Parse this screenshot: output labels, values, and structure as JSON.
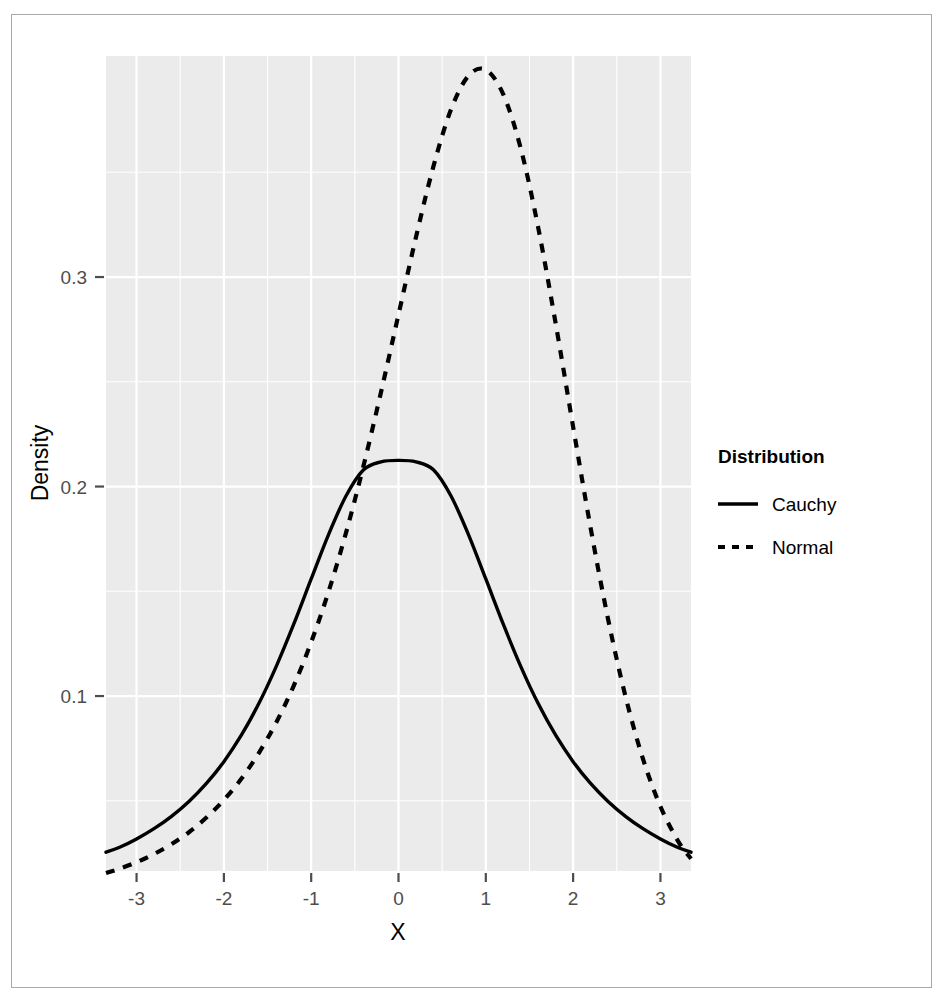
{
  "chart_data": {
    "type": "line",
    "title": "",
    "subtitle": "",
    "xlabel": "X",
    "ylabel": "Density",
    "xlim": [
      -3.35,
      3.35
    ],
    "ylim": [
      0.0165,
      0.4055
    ],
    "xticks": [
      -3,
      -2,
      -1,
      0,
      1,
      2,
      3
    ],
    "xticklabels": [
      "-3",
      "-2",
      "-1",
      "0",
      "1",
      "2",
      "3"
    ],
    "yticks": [
      0.1,
      0.2,
      0.3
    ],
    "yticklabels": [
      "0.1",
      "0.2",
      "0.3"
    ],
    "grid": true,
    "grid_color": "#ffffff",
    "panel_background": "#ebebeb",
    "legend": {
      "title": "Distribution",
      "position": "right",
      "entries": [
        {
          "name": "Cauchy",
          "linestyle": "solid",
          "color": "#000000"
        },
        {
          "name": "Normal",
          "linestyle": "dashed",
          "color": "#000000"
        }
      ]
    },
    "series": [
      {
        "name": "Cauchy",
        "linestyle": "solid",
        "color": "#000000",
        "x": [
          -3.35,
          -3.2,
          -3.0,
          -2.8,
          -2.6,
          -2.4,
          -2.2,
          -2.0,
          -1.8,
          -1.6,
          -1.4,
          -1.2,
          -1.0,
          -0.8,
          -0.6,
          -0.4,
          -0.2,
          0.0,
          0.2,
          0.4,
          0.6,
          0.8,
          1.0,
          1.2,
          1.4,
          1.6,
          1.8,
          2.0,
          2.2,
          2.4,
          2.6,
          2.8,
          3.0,
          3.2,
          3.35
        ],
        "y": [
          0.0255,
          0.0277,
          0.0318,
          0.0367,
          0.0426,
          0.0497,
          0.0583,
          0.0687,
          0.0813,
          0.0964,
          0.1142,
          0.1343,
          0.1559,
          0.1772,
          0.1956,
          0.208,
          0.2118,
          0.2125,
          0.2118,
          0.208,
          0.1956,
          0.1772,
          0.1559,
          0.1343,
          0.1142,
          0.0964,
          0.0813,
          0.0687,
          0.0583,
          0.0497,
          0.0426,
          0.0367,
          0.0318,
          0.0277,
          0.0255
        ]
      },
      {
        "name": "Normal",
        "linestyle": "dashed",
        "color": "#000000",
        "x": [
          -3.35,
          -3.2,
          -3.0,
          -2.8,
          -2.6,
          -2.4,
          -2.2,
          -2.0,
          -1.8,
          -1.6,
          -1.4,
          -1.2,
          -1.0,
          -0.8,
          -0.6,
          -0.4,
          -0.2,
          0.0,
          0.2,
          0.4,
          0.6,
          0.8,
          1.0,
          1.2,
          1.4,
          1.6,
          1.8,
          2.0,
          2.2,
          2.4,
          2.6,
          2.8,
          3.0,
          3.2,
          3.35
        ],
        "y": [
          0.0155,
          0.0175,
          0.0207,
          0.0246,
          0.0293,
          0.035,
          0.042,
          0.0504,
          0.0605,
          0.0728,
          0.0874,
          0.1049,
          0.1257,
          0.15,
          0.1781,
          0.21,
          0.2451,
          0.2821,
          0.319,
          0.3528,
          0.3798,
          0.396,
          0.3989,
          0.3872,
          0.3614,
          0.3236,
          0.2778,
          0.2285,
          0.1803,
          0.1368,
          0.0998,
          0.07,
          0.0473,
          0.0309,
          0.0224
        ]
      }
    ],
    "notes": {
      "cauchy_scale": 1.5,
      "cauchy_location": 0,
      "normal_mean": 0,
      "normal_sd": 1
    }
  }
}
